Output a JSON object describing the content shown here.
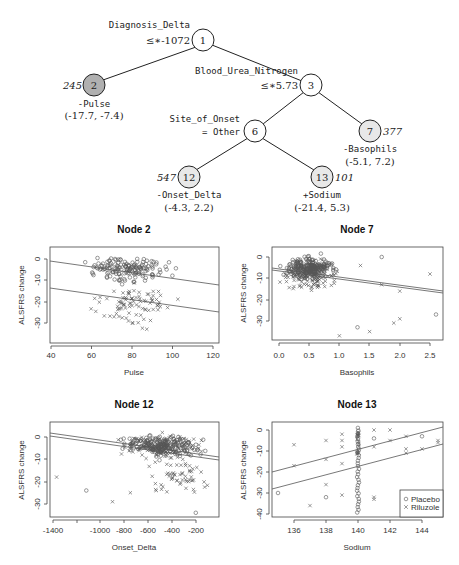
{
  "tree": {
    "nodes": [
      {
        "id": "1",
        "label": "1",
        "split_var": "Diagnosis_Delta",
        "split_rule": "≤* -1072",
        "fill": "#ffffff"
      },
      {
        "id": "2",
        "label": "2",
        "n": "245",
        "model": "-Pulse",
        "interval": "(-17.7, -7.4)",
        "fill": "#b0b0b0"
      },
      {
        "id": "3",
        "label": "3",
        "split_var": "Blood_Urea_Nitrogen",
        "split_rule": "≤* 5.73",
        "fill": "#ffffff"
      },
      {
        "id": "6",
        "label": "6",
        "split_var": "Site_of_Onset",
        "split_rule": "= Other",
        "fill": "#ffffff"
      },
      {
        "id": "7",
        "label": "7",
        "n": "377",
        "model": "-Basophils",
        "interval": "(-5.1, 7.2)",
        "fill": "#e8e8e8"
      },
      {
        "id": "12",
        "label": "12",
        "n": "547",
        "model": "-Onset_Delta",
        "interval": "(-4.3, 2.2)",
        "fill": "#e8e8e8"
      },
      {
        "id": "13",
        "label": "13",
        "n": "101",
        "model": "+Sodium",
        "interval": "(-21.4, 5.3)",
        "fill": "#e8e8e8"
      }
    ],
    "labels": {
      "n1_var": "Diagnosis_Delta",
      "n1_rule": "≤∗-1072",
      "n3_var": "Blood_Urea_Nitrogen",
      "n3_rule": "≤∗5.73",
      "n6_var": "Site_of_Onset",
      "n6_rule": "= Other",
      "n2_n": "245",
      "n2_model": "-Pulse",
      "n2_int": "(-17.7, -7.4)",
      "n7_n": "377",
      "n7_model": "-Basophils",
      "n7_int": "(-5.1, 7.2)",
      "n12_n": "547",
      "n12_model": "-Onset_Delta",
      "n12_int": "(-4.3, 2.2)",
      "n13_n": "101",
      "n13_model": "+Sodium",
      "n13_int": "(-21.4, 5.3)",
      "id1": "1",
      "id2": "2",
      "id3": "3",
      "id6": "6",
      "id7": "7",
      "id12": "12",
      "id13": "13"
    }
  },
  "chart_data": [
    {
      "type": "scatter",
      "title": "Node 2",
      "xlabel": "Pulse",
      "ylabel": "ALSFRS change",
      "xticks": [
        "40",
        "60",
        "80",
        "100",
        "120"
      ],
      "yticks": [
        "0",
        "-10",
        "-20",
        "-30"
      ],
      "xlim": [
        40,
        123
      ],
      "ylim": [
        -37,
        4
      ],
      "series": [
        {
          "name": "Placebo",
          "marker": "o",
          "fit_line": {
            "x": [
              40,
              123
            ],
            "y": [
              -1,
              -12.5
            ]
          }
        },
        {
          "name": "Riluzole",
          "marker": "x",
          "fit_line": {
            "x": [
              40,
              123
            ],
            "y": [
              -13.5,
              -25
            ]
          }
        }
      ]
    },
    {
      "type": "scatter",
      "title": "Node 7",
      "xlabel": "Basophils",
      "ylabel": "ALSFRS change",
      "xticks": [
        "0.0",
        "0.5",
        "1.0",
        "1.5",
        "2.0",
        "2.5"
      ],
      "yticks": [
        "0",
        "-10",
        "-20",
        "-30"
      ],
      "xlim": [
        -0.1,
        2.7
      ],
      "ylim": [
        -38,
        4
      ],
      "series": [
        {
          "name": "Placebo",
          "marker": "o",
          "fit_line": {
            "x": [
              -0.1,
              2.7
            ],
            "y": [
              -5,
              -15.5
            ]
          }
        },
        {
          "name": "Riluzole",
          "marker": "x",
          "fit_line": {
            "x": [
              -0.1,
              2.7
            ],
            "y": [
              -6,
              -16.5
            ]
          }
        }
      ]
    },
    {
      "type": "scatter",
      "title": "Node 12",
      "xlabel": "Onset_Delta",
      "ylabel": "ALSFRS change",
      "xticks": [
        "-1400",
        "-1000",
        "-800",
        "-600",
        "-400",
        "-200"
      ],
      "yticks": [
        "0",
        "-10",
        "-20",
        "-30"
      ],
      "xlim": [
        -1420,
        -70
      ],
      "ylim": [
        -35,
        6
      ],
      "series": [
        {
          "name": "Placebo",
          "marker": "o",
          "fit_line": {
            "x": [
              -1420,
              -70
            ],
            "y": [
              1.5,
              -9
            ]
          }
        },
        {
          "name": "Riluzole",
          "marker": "x",
          "fit_line": {
            "x": [
              -1420,
              -70
            ],
            "y": [
              0.5,
              -10
            ]
          }
        }
      ]
    },
    {
      "type": "scatter",
      "title": "Node 13",
      "xlabel": "Sodium",
      "ylabel": "ALSFRS change",
      "xticks": [
        "136",
        "138",
        "140",
        "142",
        "144"
      ],
      "yticks": [
        "0",
        "-10",
        "-20",
        "-30",
        "-40"
      ],
      "xlim": [
        134.7,
        145.4
      ],
      "ylim": [
        -41,
        3
      ],
      "legend": {
        "position": "bottom-right",
        "entries": [
          "Placebo",
          "Riluzole"
        ]
      },
      "series": [
        {
          "name": "Placebo",
          "marker": "o",
          "fit_line": {
            "x": [
              134.7,
              145.4
            ],
            "y": [
              -20,
              1.5
            ]
          }
        },
        {
          "name": "Riluzole",
          "marker": "x",
          "fit_line": {
            "x": [
              134.7,
              145.4
            ],
            "y": [
              -28,
              -7
            ]
          }
        }
      ]
    }
  ],
  "plots": {
    "n2": {
      "title": "Node 2",
      "xlabel": "Pulse",
      "ylabel": "ALSFRS change",
      "xt": [
        "40",
        "60",
        "80",
        "100",
        "120"
      ],
      "yt": [
        "0",
        "-10",
        "-20",
        "-30"
      ]
    },
    "n7": {
      "title": "Node 7",
      "xlabel": "Basophils",
      "ylabel": "ALSFRS change",
      "xt": [
        "0.0",
        "0.5",
        "1.0",
        "1.5",
        "2.0",
        "2.5"
      ],
      "yt": [
        "0",
        "-10",
        "-20",
        "-30"
      ]
    },
    "n12": {
      "title": "Node 12",
      "xlabel": "Onset_Delta",
      "ylabel": "ALSFRS change",
      "xt": [
        "-1400",
        "-1000",
        "-800",
        "-600",
        "-400",
        "-200"
      ],
      "yt": [
        "0",
        "-10",
        "-20",
        "-30"
      ]
    },
    "n13": {
      "title": "Node 13",
      "xlabel": "Sodium",
      "ylabel": "ALSFRS change",
      "xt": [
        "136",
        "138",
        "140",
        "142",
        "144"
      ],
      "yt": [
        "0",
        "-10",
        "-20",
        "-30",
        "-40"
      ],
      "legend": {
        "placebo": "Placebo",
        "riluzole": "Riluzole"
      }
    }
  }
}
